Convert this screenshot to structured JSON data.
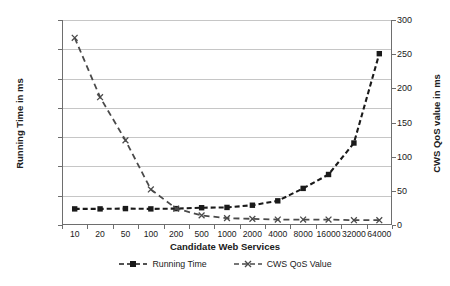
{
  "chart_data": {
    "type": "line",
    "title": "",
    "xlabel": "Candidate Web Services",
    "ylabel": "Running Time in ms",
    "y2label": "CWS QoS value in ms",
    "categories": [
      "10",
      "20",
      "50",
      "100",
      "200",
      "500",
      "1000",
      "2000",
      "4000",
      "8000",
      "16000",
      "32000",
      "64000"
    ],
    "ylim": [
      0,
      1400
    ],
    "ytick_labels": [
      "0",
      "200",
      "400",
      "600",
      "800",
      "1000",
      "1200",
      "1400"
    ],
    "y2lim": [
      0,
      300
    ],
    "y2tick_labels": [
      "0",
      "50",
      "100",
      "150",
      "200",
      "250",
      "300"
    ],
    "grid": true,
    "legend_position": "bottom",
    "series": [
      {
        "name": "Running Time",
        "axis": "left",
        "marker": "square",
        "linestyle": "dashed",
        "color": "#1a1a1a",
        "values": [
          110,
          110,
          112,
          110,
          112,
          118,
          120,
          135,
          165,
          250,
          345,
          560,
          1170
        ]
      },
      {
        "name": "CWS QoS Value",
        "axis": "right",
        "marker": "x",
        "linestyle": "dashed",
        "color": "#4a4a4a",
        "values": [
          274,
          187,
          124,
          52,
          24,
          14,
          10,
          9,
          8,
          8,
          8,
          7,
          7
        ]
      }
    ]
  },
  "legend": {
    "items": [
      {
        "label": "Running Time"
      },
      {
        "label": "CWS QoS Value"
      }
    ]
  }
}
